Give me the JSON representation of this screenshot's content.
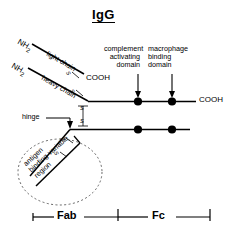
{
  "figure": {
    "title": "IgG",
    "kind": "antibody-structure-diagram"
  },
  "terminals": {
    "light_chain_n_terminus": "NH2",
    "heavy_chain_n_terminus": "NH2",
    "light_chain_c_terminus": "COOH",
    "heavy_chain_c_terminus": "COOH"
  },
  "chains": {
    "light_chain_label": "light chain",
    "heavy_chain_label": "heavy chain"
  },
  "hinge": {
    "label": "hinge"
  },
  "domains": [
    {
      "id": "complement-activating-domain",
      "lines": [
        "complement",
        "activating",
        "domain"
      ],
      "align": "right",
      "marker_x": 138
    },
    {
      "id": "macrophage-binding-domain",
      "lines": [
        "macrophage",
        "binding",
        "domain"
      ],
      "align": "left",
      "marker_x": 172
    }
  ],
  "variable_region": {
    "lines": [
      "antigen",
      "binding variable",
      "region"
    ]
  },
  "disulfides": {
    "symbol": "S",
    "count_labels": [
      "S",
      "S"
    ]
  },
  "scale_bar": {
    "segments": [
      {
        "label": "Fab",
        "start_x": 33,
        "end_x": 118
      },
      {
        "label": "Fc",
        "start_x": 118,
        "end_x": 210
      }
    ]
  },
  "colors": {
    "ink": "#000000",
    "background": "#ffffff",
    "dotted": "#555555"
  }
}
